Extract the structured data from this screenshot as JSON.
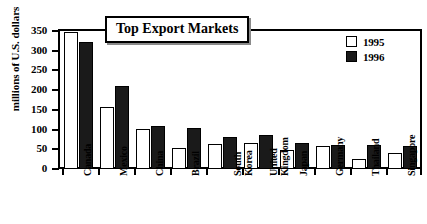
{
  "chart_data": {
    "type": "bar",
    "title": "Top Export Markets",
    "xlabel": "",
    "ylabel": "millions of U.S. dollars",
    "ylim": [
      0,
      350
    ],
    "yticks": [
      0,
      50,
      100,
      150,
      200,
      250,
      300,
      350
    ],
    "grid": false,
    "legend_position": "top-right",
    "categories": [
      "Canada",
      "Mexico",
      "China",
      "Brazil",
      "South\nKorea",
      "United\nKingdom",
      "Japan",
      "Germany",
      "Thailand",
      "Singapore"
    ],
    "series": [
      {
        "name": "1995",
        "color": "#ffffff",
        "values": [
          348,
          158,
          102,
          54,
          63,
          66,
          48,
          58,
          26,
          40
        ]
      },
      {
        "name": "1996",
        "color": "#1a1a1a",
        "values": [
          322,
          210,
          108,
          105,
          82,
          87,
          67,
          62,
          60,
          58
        ]
      }
    ]
  },
  "legend": {
    "items": [
      {
        "label": "1995",
        "swatch": "white"
      },
      {
        "label": "1996",
        "swatch": "black"
      }
    ]
  }
}
